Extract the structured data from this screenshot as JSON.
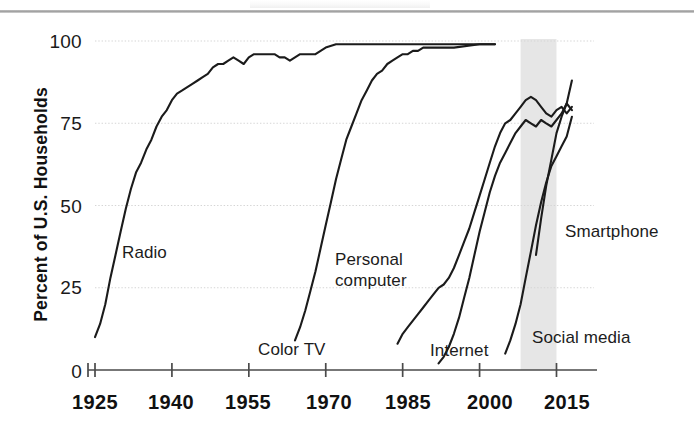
{
  "figure": {
    "ylabel": "Percent of U.S. Households",
    "y_ticks": [
      "0",
      "25",
      "50",
      "75",
      "100"
    ],
    "x_ticks": [
      "1925",
      "1940",
      "1955",
      "1970",
      "1985",
      "2000",
      "2015"
    ],
    "band_label": "shaded-period-band",
    "ink_color": "#1b1b1b",
    "grid_color": "#d5d5d5",
    "band_color": "#e2e2e2"
  },
  "labels": {
    "radio": "Radio",
    "color_tv": "Color TV",
    "personal_computer_line1": "Personal",
    "personal_computer_line2": "computer",
    "internet": "Internet",
    "social_media": "Social media",
    "smartphone": "Smartphone"
  },
  "chart_data": {
    "type": "line",
    "title": "",
    "xlabel": "",
    "ylabel": "Percent of U.S. Households",
    "xlim": [
      1925,
      2019
    ],
    "ylim": [
      0,
      100
    ],
    "x_ticks": [
      1925,
      1940,
      1955,
      1970,
      1985,
      2000,
      2015
    ],
    "y_ticks": [
      0,
      25,
      50,
      75,
      100
    ],
    "grid": "horizontal",
    "legend": "inline-labels",
    "shaded_band": {
      "x_start": 2008,
      "x_end": 2015
    },
    "series": [
      {
        "name": "Radio",
        "label_x": 1934,
        "label_y": 35,
        "points": [
          [
            1925,
            10
          ],
          [
            1926,
            14
          ],
          [
            1927,
            20
          ],
          [
            1928,
            28
          ],
          [
            1929,
            35
          ],
          [
            1930,
            42
          ],
          [
            1931,
            49
          ],
          [
            1932,
            55
          ],
          [
            1933,
            60
          ],
          [
            1934,
            63
          ],
          [
            1935,
            67
          ],
          [
            1936,
            70
          ],
          [
            1937,
            74
          ],
          [
            1938,
            77
          ],
          [
            1939,
            79
          ],
          [
            1940,
            82
          ],
          [
            1941,
            84
          ],
          [
            1942,
            85
          ],
          [
            1943,
            86
          ],
          [
            1944,
            87
          ],
          [
            1945,
            88
          ],
          [
            1946,
            89
          ],
          [
            1947,
            90
          ],
          [
            1948,
            92
          ],
          [
            1949,
            93
          ],
          [
            1950,
            93
          ],
          [
            1951,
            94
          ],
          [
            1952,
            95
          ],
          [
            1953,
            94
          ],
          [
            1954,
            93
          ],
          [
            1955,
            95
          ],
          [
            1956,
            96
          ],
          [
            1957,
            96
          ],
          [
            1958,
            96
          ],
          [
            1959,
            96
          ],
          [
            1960,
            96
          ],
          [
            1961,
            95
          ],
          [
            1962,
            95
          ],
          [
            1963,
            94
          ],
          [
            1964,
            95
          ],
          [
            1965,
            96
          ],
          [
            1966,
            96
          ],
          [
            1967,
            96
          ],
          [
            1968,
            96
          ],
          [
            1969,
            97
          ],
          [
            1970,
            98
          ],
          [
            1972,
            99
          ],
          [
            1975,
            99
          ],
          [
            1980,
            99
          ],
          [
            1985,
            99
          ],
          [
            1990,
            99
          ],
          [
            1995,
            99
          ],
          [
            2000,
            99
          ],
          [
            2003,
            99
          ]
        ]
      },
      {
        "name": "Color TV",
        "label_x": 1957,
        "label_y": 6,
        "points": [
          [
            1964,
            9
          ],
          [
            1965,
            13
          ],
          [
            1966,
            18
          ],
          [
            1967,
            24
          ],
          [
            1968,
            30
          ],
          [
            1969,
            37
          ],
          [
            1970,
            44
          ],
          [
            1971,
            51
          ],
          [
            1972,
            58
          ],
          [
            1973,
            64
          ],
          [
            1974,
            70
          ],
          [
            1975,
            74
          ],
          [
            1976,
            78
          ],
          [
            1977,
            82
          ],
          [
            1978,
            85
          ],
          [
            1979,
            88
          ],
          [
            1980,
            90
          ],
          [
            1981,
            91
          ],
          [
            1982,
            93
          ],
          [
            1983,
            94
          ],
          [
            1984,
            95
          ],
          [
            1985,
            96
          ],
          [
            1986,
            96
          ],
          [
            1987,
            97
          ],
          [
            1988,
            97
          ],
          [
            1989,
            98
          ],
          [
            1990,
            98
          ],
          [
            1992,
            98
          ],
          [
            1995,
            98
          ],
          [
            2000,
            99
          ],
          [
            2003,
            99
          ]
        ]
      },
      {
        "name": "Personal computer",
        "label_x": 1976,
        "label_y": 30,
        "points": [
          [
            1984,
            8
          ],
          [
            1985,
            11
          ],
          [
            1986,
            13
          ],
          [
            1987,
            15
          ],
          [
            1988,
            17
          ],
          [
            1989,
            19
          ],
          [
            1990,
            21
          ],
          [
            1991,
            23
          ],
          [
            1992,
            25
          ],
          [
            1993,
            26
          ],
          [
            1994,
            28
          ],
          [
            1995,
            31
          ],
          [
            1996,
            35
          ],
          [
            1997,
            39
          ],
          [
            1998,
            43
          ],
          [
            1999,
            48
          ],
          [
            2000,
            53
          ],
          [
            2001,
            58
          ],
          [
            2002,
            63
          ],
          [
            2003,
            68
          ],
          [
            2004,
            72
          ],
          [
            2005,
            75
          ],
          [
            2006,
            76
          ],
          [
            2007,
            78
          ],
          [
            2008,
            80
          ],
          [
            2009,
            82
          ],
          [
            2010,
            83
          ],
          [
            2011,
            82
          ],
          [
            2012,
            80
          ],
          [
            2013,
            78
          ],
          [
            2014,
            77
          ],
          [
            2015,
            79
          ],
          [
            2016,
            80
          ],
          [
            2017,
            78
          ],
          [
            2018,
            80
          ]
        ]
      },
      {
        "name": "Internet",
        "label_x": 1992,
        "label_y": 5,
        "points": [
          [
            1992,
            2
          ],
          [
            1993,
            4
          ],
          [
            1994,
            7
          ],
          [
            1995,
            11
          ],
          [
            1996,
            16
          ],
          [
            1997,
            22
          ],
          [
            1998,
            28
          ],
          [
            1999,
            35
          ],
          [
            2000,
            42
          ],
          [
            2001,
            48
          ],
          [
            2002,
            54
          ],
          [
            2003,
            59
          ],
          [
            2004,
            63
          ],
          [
            2005,
            66
          ],
          [
            2006,
            69
          ],
          [
            2007,
            72
          ],
          [
            2008,
            74
          ],
          [
            2009,
            76
          ],
          [
            2010,
            75
          ],
          [
            2011,
            74
          ],
          [
            2012,
            76
          ],
          [
            2013,
            75
          ],
          [
            2014,
            74
          ],
          [
            2015,
            76
          ],
          [
            2016,
            78
          ],
          [
            2017,
            81
          ],
          [
            2018,
            79
          ]
        ]
      },
      {
        "name": "Social media",
        "label_x": 2006,
        "label_y": 7,
        "points": [
          [
            2005,
            5
          ],
          [
            2006,
            9
          ],
          [
            2007,
            14
          ],
          [
            2008,
            20
          ],
          [
            2009,
            28
          ],
          [
            2010,
            36
          ],
          [
            2011,
            44
          ],
          [
            2012,
            51
          ],
          [
            2013,
            57
          ],
          [
            2014,
            62
          ],
          [
            2015,
            65
          ],
          [
            2016,
            68
          ],
          [
            2017,
            71
          ],
          [
            2018,
            77
          ]
        ]
      },
      {
        "name": "Smartphone",
        "label_x": 2013,
        "label_y": 40,
        "points": [
          [
            2011,
            35
          ],
          [
            2012,
            46
          ],
          [
            2013,
            56
          ],
          [
            2014,
            64
          ],
          [
            2015,
            72
          ],
          [
            2016,
            77
          ],
          [
            2017,
            81
          ],
          [
            2018,
            88
          ]
        ]
      }
    ]
  }
}
